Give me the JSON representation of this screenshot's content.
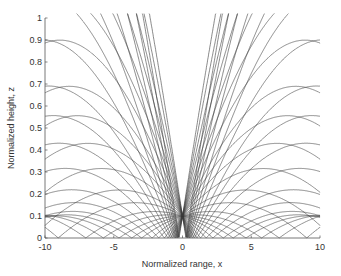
{
  "chart_data": {
    "type": "line",
    "title": "",
    "xlabel": "Normalized range,  x",
    "ylabel": "Normalized height,  z",
    "xlim": [
      -10,
      10
    ],
    "ylim": [
      0,
      1
    ],
    "xticks": [
      -10,
      -5,
      0,
      5,
      10
    ],
    "yticks": [
      0,
      0.1,
      0.2,
      0.3,
      0.4,
      0.5,
      0.6,
      0.7,
      0.8,
      0.9,
      1
    ],
    "grid": false,
    "legend": null,
    "source_point": {
      "x": 0,
      "z": 0.1
    },
    "series": {
      "ray_slopes": [
        -0.4,
        -0.35,
        -0.3,
        -0.26,
        -0.22,
        -0.19,
        -0.16,
        -0.13,
        -0.11,
        -0.09,
        -0.07,
        -0.05,
        -0.035,
        -0.02,
        -0.01,
        0.0,
        0.01,
        0.02,
        0.035,
        0.05,
        0.07,
        0.09,
        0.11,
        0.13,
        0.16,
        0.19,
        0.22,
        0.26,
        0.3,
        0.35,
        0.4
      ],
      "curvature": 0.004,
      "color": "#3a3a3a"
    }
  },
  "axes": {
    "x_tick_labels": [
      "-10",
      "-5",
      "0",
      "5",
      "10"
    ],
    "y_tick_labels": [
      "0",
      "0.1",
      "0.2",
      "0.3",
      "0.4",
      "0.5",
      "0.6",
      "0.7",
      "0.8",
      "0.9",
      "1"
    ]
  }
}
